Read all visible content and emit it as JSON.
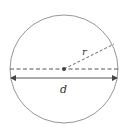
{
  "diagram": {
    "type": "circle-geometry",
    "labels": {
      "radius": "r",
      "diameter": "d"
    },
    "colors": {
      "stroke": "#8a8a8a",
      "dash": "#555555",
      "arrow": "#444444",
      "center_dot": "#444444"
    }
  }
}
